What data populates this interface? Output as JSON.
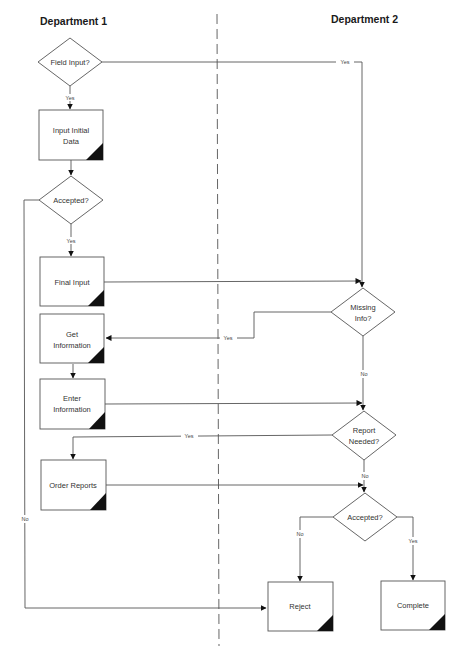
{
  "lanes": {
    "left": {
      "title": "Department 1"
    },
    "right": {
      "title": "Department 2"
    }
  },
  "nodes": {
    "field_input": {
      "type": "decision",
      "lines": [
        "Field Input?"
      ]
    },
    "input_initial_data": {
      "type": "process",
      "lines": [
        "Input Initial",
        "Data"
      ]
    },
    "accepted_1": {
      "type": "decision",
      "lines": [
        "Accepted?"
      ]
    },
    "final_input": {
      "type": "process",
      "lines": [
        "Final Input"
      ]
    },
    "get_information": {
      "type": "process",
      "lines": [
        "Get",
        "Information"
      ]
    },
    "enter_information": {
      "type": "process",
      "lines": [
        "Enter",
        "Information"
      ]
    },
    "order_reports": {
      "type": "process",
      "lines": [
        "Order Reports"
      ]
    },
    "missing_info": {
      "type": "decision",
      "lines": [
        "Missing",
        "Info?"
      ]
    },
    "report_needed": {
      "type": "decision",
      "lines": [
        "Report",
        "Needed?"
      ]
    },
    "accepted_2": {
      "type": "decision",
      "lines": [
        "Accepted?"
      ]
    },
    "reject": {
      "type": "process",
      "lines": [
        "Reject"
      ]
    },
    "complete": {
      "type": "process",
      "lines": [
        "Complete"
      ]
    }
  },
  "edges": {
    "field_yes_down": {
      "from": "field_input",
      "to": "input_initial_data",
      "label": "Yes"
    },
    "field_yes_right": {
      "from": "field_input",
      "to": "missing_info",
      "label": "Yes"
    },
    "initial_to_accepted": {
      "from": "input_initial_data",
      "to": "accepted_1",
      "label": ""
    },
    "accepted1_yes": {
      "from": "accepted_1",
      "to": "final_input",
      "label": "Yes"
    },
    "accepted1_no": {
      "from": "accepted_1",
      "to": "reject",
      "label": "No"
    },
    "final_to_missing": {
      "from": "final_input",
      "to": "missing_info",
      "label": ""
    },
    "missing_yes": {
      "from": "missing_info",
      "to": "get_information",
      "label": "Yes"
    },
    "missing_no": {
      "from": "missing_info",
      "to": "report_needed",
      "label": "No"
    },
    "get_to_enter": {
      "from": "get_information",
      "to": "enter_information",
      "label": ""
    },
    "enter_to_report": {
      "from": "enter_information",
      "to": "report_needed",
      "label": ""
    },
    "report_yes": {
      "from": "report_needed",
      "to": "order_reports",
      "label": "Yes"
    },
    "report_no": {
      "from": "report_needed",
      "to": "accepted_2",
      "label": "No"
    },
    "order_to_accepted2": {
      "from": "order_reports",
      "to": "accepted_2",
      "label": ""
    },
    "accepted2_no": {
      "from": "accepted_2",
      "to": "reject",
      "label": "No"
    },
    "accepted2_yes": {
      "from": "accepted_2",
      "to": "complete",
      "label": "Yes"
    }
  },
  "colors": {
    "stroke": "#555555",
    "corner": "#111111",
    "text": "#333333"
  }
}
